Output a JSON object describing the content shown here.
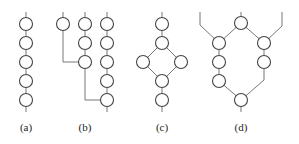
{
  "figure": {
    "subfigures": [
      {
        "id": "a",
        "label": "(a)",
        "description": "single chain of 5 nodes"
      },
      {
        "id": "b",
        "label": "(b)",
        "description": "three chains of 1, 3 and 5 nodes; first chain joins middle chain at node 3, middle chain joins third chain at node 5"
      },
      {
        "id": "c",
        "label": "(c)",
        "description": "chain splitting into two branches (diamond) then rejoining, 6 nodes"
      },
      {
        "id": "d",
        "label": "(d)",
        "description": "ring-like structure: top node, left branch of 3 nodes, right branch of 2 nodes, bottom node, with two outer input lines"
      }
    ]
  },
  "colors": {
    "line": "#777777",
    "node_stroke": "#444444",
    "node_fill": "#ffffff",
    "background": "#ffffff"
  }
}
